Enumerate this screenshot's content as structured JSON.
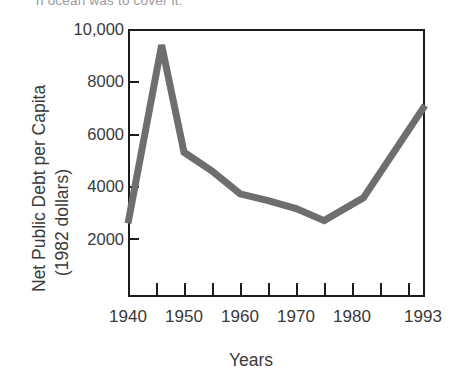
{
  "figure": {
    "caption_fragment": "n ocean was to cover it.",
    "line_color": "#6e6e6e",
    "axis_color": "#1c1c1c",
    "background": "#ffffff"
  },
  "chart_data": {
    "type": "line",
    "title": "",
    "xlabel": "Years",
    "ylabel_line1": "Net Public Debt per Capita",
    "ylabel_line2": "(1982 dollars)",
    "xlim": [
      1940,
      1993
    ],
    "ylim": [
      0,
      10000
    ],
    "grid": false,
    "legend": "none",
    "ytick_labels": [
      "10,000",
      "8000",
      "6000",
      "4000",
      "2000"
    ],
    "ytick_values": [
      10000,
      8000,
      6000,
      4000,
      2000
    ],
    "xtick_labels": [
      "1940",
      "1950",
      "1960",
      "1970",
      "1980",
      "1993"
    ],
    "xtick_values": [
      1940,
      1950,
      1960,
      1970,
      1980,
      1993
    ],
    "xtick_minor_values": [
      1945,
      1955,
      1965,
      1975,
      1985
    ],
    "series": [
      {
        "name": "Net public debt per capita (1982 dollars)",
        "x": [
          1940,
          1946,
          1950,
          1955,
          1960,
          1965,
          1970,
          1975,
          1982,
          1993
        ],
        "values": [
          2750,
          9400,
          5400,
          4700,
          3850,
          3600,
          3300,
          2850,
          3700,
          7150
        ]
      }
    ]
  },
  "axis_labels": {
    "y": [
      "10,000",
      "8000",
      "6000",
      "4000",
      "2000"
    ],
    "x": [
      "1940",
      "1950",
      "1960",
      "1970",
      "1980",
      "1993"
    ]
  }
}
